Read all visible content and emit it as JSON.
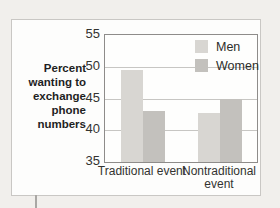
{
  "figure": {
    "page_background": "#f1efec",
    "box_background": "#fdfdfc",
    "box_border_color": "#c9c7c4",
    "plot_border_color": "#8e8c8a",
    "gridline_color": "#c7c6c3"
  },
  "chart_data": {
    "type": "bar",
    "title": "",
    "ylabel": "Percent\nwanting to\nexchange\nphone\nnumbers",
    "xlabel": "",
    "categories": [
      "Traditional event",
      "Nontraditional event"
    ],
    "series": [
      {
        "name": "Men",
        "values": [
          49.5,
          42.7
        ],
        "color": "#d8d6d2"
      },
      {
        "name": "Women",
        "values": [
          43.0,
          45.0
        ],
        "color": "#c3c1bd"
      }
    ],
    "ylim": [
      35,
      55
    ],
    "yticks": [
      35,
      40,
      45,
      50,
      55
    ],
    "grid": "horizontal",
    "legend_position": "top-right",
    "bar_width_px": 22
  }
}
